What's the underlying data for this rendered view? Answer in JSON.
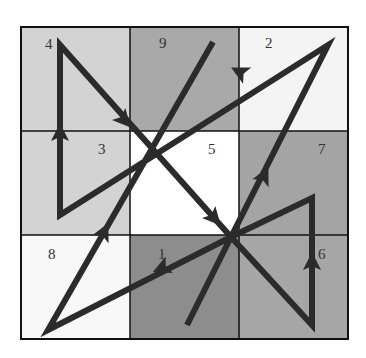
{
  "grid": {
    "x": 21,
    "y": 27,
    "cell_w": 109,
    "cell_h": 104,
    "cells": [
      {
        "row": 0,
        "col": 0,
        "value": "4",
        "fill": "#d3d3d3",
        "label_x": 45,
        "label_y": 49
      },
      {
        "row": 0,
        "col": 1,
        "value": "9",
        "fill": "#a9a9a9",
        "label_x": 159,
        "label_y": 48
      },
      {
        "row": 0,
        "col": 2,
        "value": "2",
        "fill": "#f4f4f4",
        "label_x": 265,
        "label_y": 48
      },
      {
        "row": 1,
        "col": 0,
        "value": "3",
        "fill": "#d3d3d3",
        "label_x": 98,
        "label_y": 154
      },
      {
        "row": 1,
        "col": 1,
        "value": "5",
        "fill": "#ffffff",
        "label_x": 208,
        "label_y": 154
      },
      {
        "row": 1,
        "col": 2,
        "value": "7",
        "fill": "#a4a4a4",
        "label_x": 318,
        "label_y": 154
      },
      {
        "row": 2,
        "col": 0,
        "value": "8",
        "fill": "#f8f8f8",
        "label_x": 48,
        "label_y": 259
      },
      {
        "row": 2,
        "col": 1,
        "value": "1",
        "fill": "#8d8d8d",
        "label_x": 158,
        "label_y": 259
      },
      {
        "row": 2,
        "col": 2,
        "value": "6",
        "fill": "#a6a6a6",
        "label_x": 318,
        "label_y": 259
      }
    ]
  },
  "path": {
    "color": "#2b2b2b",
    "width": 6,
    "points": [
      [
        187,
        325
      ],
      [
        231,
        237
      ],
      [
        328,
        45
      ],
      [
        60,
        215
      ],
      [
        60,
        45
      ],
      [
        231,
        237
      ],
      [
        312,
        325
      ],
      [
        312,
        198
      ],
      [
        231,
        237
      ],
      [
        48,
        330
      ],
      [
        213,
        42
      ]
    ],
    "arrows": [
      {
        "x": 240,
        "y": 72,
        "angle": 207
      },
      {
        "x": 60,
        "y": 133,
        "angle": -90
      },
      {
        "x": 124,
        "y": 120,
        "angle": 48
      },
      {
        "x": 214,
        "y": 218,
        "angle": 48
      },
      {
        "x": 312,
        "y": 262,
        "angle": -90
      },
      {
        "x": 162,
        "y": 268,
        "angle": 156
      },
      {
        "x": 104,
        "y": 232,
        "angle": -64
      },
      {
        "x": 264,
        "y": 176,
        "angle": -64
      }
    ]
  }
}
